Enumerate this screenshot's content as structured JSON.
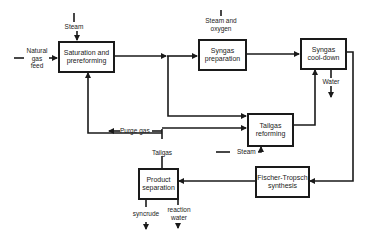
{
  "diagram": {
    "title": "",
    "process_units": [
      {
        "id": "saturation",
        "label_line1": "Saturation and",
        "label_line2": "prereforming"
      },
      {
        "id": "syngas_prep",
        "label_line1": "Syngas",
        "label_line2": "preparation"
      },
      {
        "id": "syngas_cool",
        "label_line1": "Syngas",
        "label_line2": "cool-down"
      },
      {
        "id": "tailgas_reforming",
        "label_line1": "Tailgas",
        "label_line2": "reforming"
      },
      {
        "id": "fischer_tropsch",
        "label_line1": "Fischer-Tropsch",
        "label_line2": "synthesis"
      },
      {
        "id": "product_separation",
        "label_line1": "Product",
        "label_line2": "separation"
      }
    ],
    "stream_labels": {
      "natural_gas_line1": "Natural",
      "natural_gas_line2": "gas",
      "natural_gas_line3": "feed",
      "steam_top": "Steam",
      "steam_oxygen_line1": "Steam and",
      "steam_oxygen_line2": "oxygen",
      "water": "Water",
      "purge_gas": "Purge gas",
      "tailgas": "Tailgas",
      "steam_bottom": "Steam",
      "syncrude": "syncrude",
      "reaction_water_line1": "reaction",
      "reaction_water_line2": "water"
    },
    "colors": {
      "line": "#1a1a1a",
      "background": "#ffffff"
    }
  }
}
